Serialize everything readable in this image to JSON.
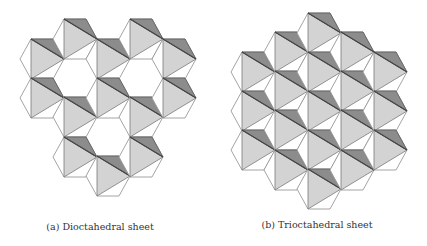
{
  "figure": {
    "panels": [
      {
        "id": "a",
        "caption": "(a) Dioctahedral sheet",
        "caption_x": 100,
        "caption_y": 221,
        "hexagons": [
          [
            42,
            59
          ],
          [
            42,
            98
          ],
          [
            75,
            39
          ],
          [
            75,
            117
          ],
          [
            75,
            157
          ],
          [
            108,
            59
          ],
          [
            108,
            98
          ],
          [
            108,
            176
          ],
          [
            141,
            39
          ],
          [
            141,
            117
          ],
          [
            141,
            157
          ],
          [
            174,
            59
          ],
          [
            174,
            98
          ]
        ],
        "vacant_sites": [
          [
            75,
            78
          ],
          [
            141,
            78
          ],
          [
            108,
            137
          ]
        ]
      },
      {
        "id": "b",
        "caption": "(b) Trioctahedral sheet",
        "caption_x": 317,
        "caption_y": 219,
        "hexagons": [
          [
            253,
            72
          ],
          [
            253,
            111
          ],
          [
            253,
            150
          ],
          [
            286,
            52
          ],
          [
            286,
            91
          ],
          [
            286,
            130
          ],
          [
            286,
            170
          ],
          [
            319,
            33
          ],
          [
            319,
            72
          ],
          [
            319,
            111
          ],
          [
            319,
            150
          ],
          [
            319,
            189
          ],
          [
            352,
            52
          ],
          [
            352,
            91
          ],
          [
            352,
            130
          ],
          [
            352,
            170
          ],
          [
            385,
            72
          ],
          [
            385,
            111
          ],
          [
            385,
            150
          ]
        ],
        "vacant_sites": []
      }
    ],
    "hexagon_geometry": {
      "half_width": 22,
      "half_height": 20
    },
    "colors": {
      "light_face": "#d3d3d3",
      "dark_face": "#8c8c8c",
      "outline": "#9a9a9a",
      "edge": "#444444",
      "background": "#ffffff"
    }
  }
}
